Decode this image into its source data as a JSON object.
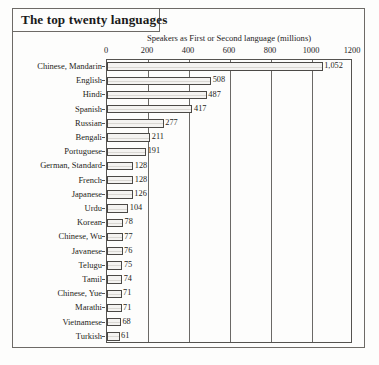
{
  "title": "The top twenty languages",
  "chart_data": {
    "type": "bar",
    "orientation": "horizontal",
    "title": "The top twenty languages",
    "subtitle": "Speakers as First or Second language (millions)",
    "xlabel": "Speakers as First or Second language (millions)",
    "ylabel": "",
    "xlim": [
      0,
      1200
    ],
    "grid": true,
    "legend": "none",
    "xticks": [
      "0",
      "200",
      "400",
      "600",
      "800",
      "1000",
      "1200"
    ],
    "xtick_values": [
      0,
      200,
      400,
      600,
      800,
      1000,
      1200
    ],
    "categories": [
      "Chinese, Mandarin",
      "English",
      "Hindi",
      "Spanish",
      "Russian",
      "Bengali",
      "Portuguese",
      "German, Standard",
      "French",
      "Japanese",
      "Urdu",
      "Korean",
      "Chinese, Wu",
      "Javanese",
      "Telugu",
      "Tamil",
      "Chinese, Yue",
      "Marathi",
      "Vietnamese",
      "Turkish"
    ],
    "values": [
      1052,
      508,
      487,
      417,
      277,
      211,
      191,
      128,
      128,
      126,
      104,
      78,
      77,
      76,
      75,
      74,
      71,
      71,
      68,
      61
    ],
    "value_labels": [
      "1,052",
      "508",
      "487",
      "417",
      "277",
      "211",
      "191",
      "128",
      "128",
      "126",
      "104",
      "78",
      "77",
      "76",
      "75",
      "74",
      "71",
      "71",
      "68",
      "61"
    ],
    "bar_fill_color": "#f4f3f1",
    "bar_border_color": "#4b4946",
    "grid_color": "#6b6966",
    "text_color": "#1f1d1a"
  }
}
